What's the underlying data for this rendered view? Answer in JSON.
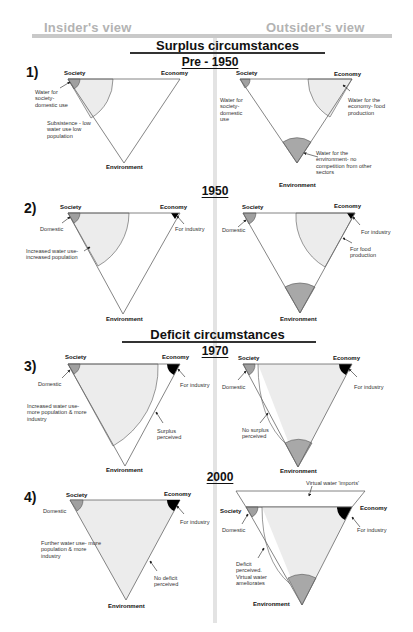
{
  "header": {
    "insider_title": "Insider's view",
    "outsider_title": "Outsider's view"
  },
  "sections": {
    "surplus": "Surplus circumstances",
    "deficit": "Deficit circumstances"
  },
  "colors": {
    "domestic_fill": "#a0a0a0",
    "large_wedge_fill": "#ececec",
    "industry_fill": "#000000",
    "environment_fill": "#a8a8a8",
    "header_gray": "#b3b3b3"
  },
  "panels": [
    {
      "number": "1)",
      "year": "Pre - 1950",
      "insider": {
        "society": "Society",
        "economy": "Economy",
        "environment": "Environment",
        "notes": [
          "Water for society- domestic use",
          "Subsistence - low water use low population"
        ]
      },
      "outsider": {
        "society": "Society",
        "economy": "Economy",
        "environment": "Environment",
        "notes": [
          "Water for society- domestic use",
          "Water for the economy- food production",
          "Water for the environment- no competition from other sectors"
        ]
      }
    },
    {
      "number": "2)",
      "year": "1950",
      "insider": {
        "society": "Society",
        "economy": "Economy",
        "environment": "Environment",
        "notes": [
          "Domestic",
          "For industry",
          "Increased water use- increased population"
        ]
      },
      "outsider": {
        "society": "Society",
        "economy": "Economy",
        "environment": "Environment",
        "notes": [
          "Domestic",
          "For industry",
          "For food production"
        ]
      }
    },
    {
      "number": "3)",
      "year": "1970",
      "insider": {
        "society": "Society",
        "economy": "Economy",
        "environment": "Environment",
        "notes": [
          "Domestic",
          "For industry",
          "Increased water use- more population & more industry",
          "Surplus perceived"
        ]
      },
      "outsider": {
        "society": "Society",
        "economy": "Economy",
        "environment": "Environment",
        "notes": [
          "Domestic",
          "For industry",
          "No surplus perceived"
        ]
      }
    },
    {
      "number": "4)",
      "year": "2000",
      "insider": {
        "society": "Society",
        "economy": "Economy",
        "environment": "Environment",
        "notes": [
          "Domestic",
          "For industry",
          "Further water use- more population & more industry",
          "No deficit perceived"
        ]
      },
      "outsider": {
        "society": "Society",
        "economy": "Economy",
        "environment": "Environment",
        "notes": [
          "Virtual water 'imports'",
          "Domestic",
          "For industry",
          "Deficit perceived. Virtual water ameliorates"
        ]
      }
    }
  ]
}
